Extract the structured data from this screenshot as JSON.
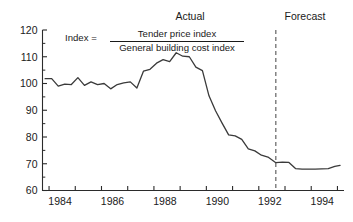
{
  "figure": {
    "background_color": "#ffffff",
    "line_color": "#3a3a3a",
    "axis_color": "#2b2b2b",
    "divider_color": "#555555"
  },
  "annotations": {
    "actual_label": "Actual",
    "forecast_label": "Forecast",
    "formula_lhs": "Index =",
    "formula_numerator": "Tender price index",
    "formula_denominator": "General building cost index"
  },
  "axes": {
    "y_tick_labels": [
      "120",
      "110",
      "100",
      "90",
      "80",
      "70",
      "60"
    ],
    "x_tick_labels": [
      "1984",
      "1986",
      "1988",
      "1990",
      "1992",
      "1994"
    ]
  },
  "chart_data": {
    "type": "line",
    "title": "",
    "subtitle": "",
    "xlabel": "",
    "ylabel": "",
    "xlim": [
      1983.75,
      1995.25
    ],
    "ylim": [
      60,
      120
    ],
    "y_ticks": [
      60,
      70,
      80,
      90,
      100,
      110,
      120
    ],
    "y_minor_ticks": [
      65,
      75,
      85,
      95,
      105,
      115
    ],
    "x_ticks": [
      1984,
      1985,
      1986,
      1987,
      1988,
      1989,
      1990,
      1991,
      1992,
      1993,
      1994,
      1995
    ],
    "x_tick_labels_shown": [
      1984,
      1986,
      1988,
      1990,
      1992,
      1994
    ],
    "grid": false,
    "legend": null,
    "divider": {
      "x": 1992.65,
      "style": "dashed",
      "label_left": "Actual",
      "label_right": "Forecast"
    },
    "annotation_formula": "Index = Tender price index / General building cost index",
    "series": [
      {
        "name": "Index = Tender price index / General building cost index",
        "x": [
          1983.85,
          1984.1,
          1984.35,
          1984.6,
          1984.85,
          1985.1,
          1985.35,
          1985.6,
          1985.85,
          1986.1,
          1986.35,
          1986.6,
          1986.85,
          1987.1,
          1987.35,
          1987.6,
          1987.85,
          1988.1,
          1988.35,
          1988.6,
          1988.85,
          1989.1,
          1989.35,
          1989.6,
          1989.85,
          1990.1,
          1990.35,
          1990.6,
          1990.85,
          1991.1,
          1991.35,
          1991.6,
          1991.85,
          1992.1,
          1992.35,
          1992.65,
          1992.9,
          1993.15,
          1993.4,
          1993.65,
          1993.9,
          1994.15,
          1994.4,
          1994.65,
          1994.9,
          1995.1
        ],
        "y": [
          101.8,
          101.8,
          99.0,
          99.8,
          99.6,
          102.2,
          99.3,
          100.6,
          99.6,
          100.0,
          98.0,
          99.6,
          100.2,
          100.6,
          98.3,
          104.6,
          105.3,
          107.6,
          108.9,
          108.2,
          111.5,
          110.2,
          110.0,
          106.1,
          104.8,
          95.4,
          89.8,
          85.2,
          80.8,
          80.4,
          79.1,
          75.6,
          74.8,
          73.2,
          72.5,
          70.4,
          70.6,
          70.5,
          68.2,
          68.0,
          68.0,
          68.0,
          68.1,
          68.2,
          69.0,
          69.4
        ]
      }
    ]
  }
}
